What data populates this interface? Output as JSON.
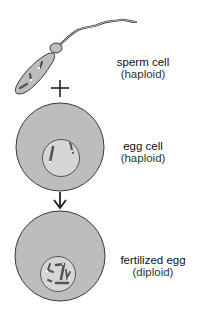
{
  "diagram": {
    "type": "fertilization",
    "colors": {
      "cytoplasm": "#bdbdbd",
      "outline": "#3a3a3a",
      "nucleus": "#d6d6d6",
      "chromosome": "#555555",
      "background": "#ffffff"
    },
    "stages": [
      {
        "id": "sperm",
        "title": "sperm cell",
        "ploidy": "(haploid)"
      },
      {
        "id": "egg",
        "title": "egg cell",
        "ploidy": "(haploid)"
      },
      {
        "id": "fertilized",
        "title": "fertilized egg",
        "ploidy": "(diploid)"
      }
    ],
    "connectors": [
      {
        "from": "sperm",
        "to": "egg",
        "symbol": "plus"
      },
      {
        "from": "egg",
        "to": "fertilized",
        "symbol": "arrow-down"
      }
    ]
  }
}
